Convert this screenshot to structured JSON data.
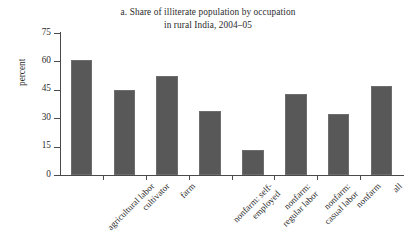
{
  "chart_data": {
    "type": "bar",
    "title": "a. Share of illiterate population by occupation in rural India, 2004–05",
    "title_lines": [
      "a. Share of illiterate population by occupation",
      "in rural India, 2004–05"
    ],
    "xlabel": "",
    "ylabel": "percent",
    "ylim": [
      0,
      75
    ],
    "yticks": [
      0,
      15,
      30,
      45,
      60,
      75
    ],
    "ytick_labels": [
      "0",
      "15",
      "30",
      "45",
      "60",
      "75"
    ],
    "grid": false,
    "legend": false,
    "bar_color": "#585858",
    "axis_color": "#4a4a4a",
    "text_color": "#2b2b2b",
    "categories": [
      "agricultural labor",
      "cultivator",
      "farm",
      "nonfarm: self-employed",
      "nonfarm: regular labor",
      "nonfarm: casual labor",
      "nonfarm",
      "all"
    ],
    "category_lines": [
      [
        "agricultural labor"
      ],
      [
        "cultivator"
      ],
      [
        "farm"
      ],
      [
        "nonfarm: self-",
        "employed"
      ],
      [
        "nonfarm:",
        "regular labor"
      ],
      [
        "nonfarm:",
        "casual labor"
      ],
      [
        "nonfarm"
      ],
      [
        "all"
      ]
    ],
    "values": [
      60.5,
      45.0,
      52.5,
      34.0,
      13.0,
      43.0,
      32.0,
      47.0
    ]
  }
}
